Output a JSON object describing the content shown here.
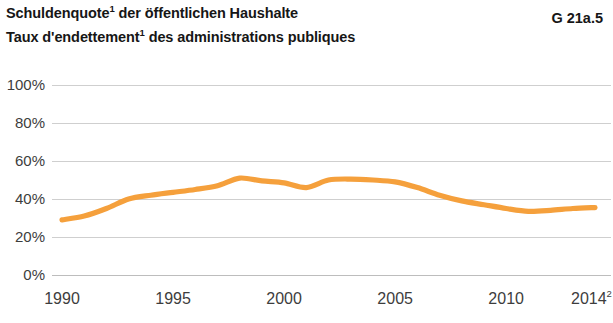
{
  "figure": {
    "code": "G 21a.5",
    "title_de": "Schuldenquote",
    "title_de_sup": "1",
    "title_de_rest": " der öffentlichen Haushalte",
    "title_fr": "Taux d'endettement",
    "title_fr_sup": "1",
    "title_fr_rest": " des administrations publiques"
  },
  "colors": {
    "series": "#F5A03C",
    "grid": "#cfcfcf",
    "text": "#3d3d3d",
    "title": "#161616",
    "background": "#ffffff"
  },
  "chart_data": {
    "type": "line",
    "xlabel": "",
    "ylabel": "",
    "xlim": [
      1990,
      2014
    ],
    "ylim": [
      0,
      100
    ],
    "grid": true,
    "legend": "none",
    "x_tick_labels": [
      "1990",
      "1995",
      "2000",
      "2005",
      "2010",
      "2014"
    ],
    "x_tick_values": [
      1990,
      1995,
      2000,
      2005,
      2010,
      2014
    ],
    "x_last_superscript": "2",
    "y_tick_labels": [
      "0%",
      "20%",
      "40%",
      "60%",
      "80%",
      "100%"
    ],
    "y_tick_values": [
      0,
      20,
      40,
      60,
      80,
      100
    ],
    "series": [
      {
        "name": "Schuldenquote / Taux d'endettement",
        "color": "#F5A03C",
        "x": [
          1990,
          1991,
          1992,
          1993,
          1994,
          1995,
          1996,
          1997,
          1998,
          1999,
          2000,
          2001,
          2002,
          2003,
          2004,
          2005,
          2006,
          2007,
          2008,
          2009,
          2010,
          2011,
          2012,
          2013,
          2014
        ],
        "values": [
          29,
          31,
          35,
          40,
          42,
          43.5,
          45,
          47,
          51,
          49.5,
          48.5,
          46,
          50,
          50.5,
          50,
          49,
          46,
          42,
          39,
          37,
          35,
          33.5,
          34,
          35,
          35.5
        ]
      }
    ]
  }
}
